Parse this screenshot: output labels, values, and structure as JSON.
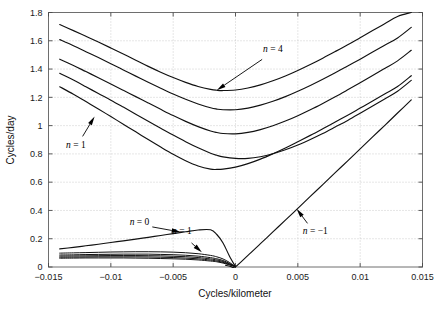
{
  "chart_data": {
    "type": "line",
    "title": "",
    "subtitle": "",
    "xlabel": "Cycles/kilometer",
    "ylabel": "Cycles/day",
    "xlim": [
      -0.015,
      0.015
    ],
    "ylim": [
      0,
      1.8
    ],
    "xticks": [
      -0.015,
      -0.01,
      -0.005,
      0,
      0.005,
      0.01,
      0.015
    ],
    "xticklabels": [
      "-0.015",
      "-0.01",
      "-0.005",
      "0",
      "0.005",
      "0.01",
      "0.015"
    ],
    "yticks": [
      0,
      0.2,
      0.4,
      0.6,
      0.8,
      1,
      1.2,
      1.4,
      1.6,
      1.8
    ],
    "yticklabels": [
      "0",
      "0.2",
      "0.4",
      "0.6",
      "0.8",
      "1",
      "1.2",
      "1.4",
      "1.6",
      "1.8"
    ],
    "grid": true,
    "legend_position": "none",
    "line_color": "#111111",
    "grid_color": "#b9b9b9",
    "frame_color": "#6e6e6e",
    "series": [
      {
        "name": "upper-branch-5",
        "comment": "highest U-shaped dispersion curve",
        "x": [
          -0.0141,
          -0.013,
          -0.012,
          -0.011,
          -0.01,
          -0.009,
          -0.008,
          -0.007,
          -0.006,
          -0.005,
          -0.004,
          -0.003,
          -0.002,
          -0.0015,
          -0.001,
          0.0,
          0.001,
          0.002,
          0.003,
          0.004,
          0.005,
          0.006,
          0.007,
          0.008,
          0.009,
          0.01,
          0.011,
          0.012,
          0.013,
          0.0141
        ],
        "y": [
          1.715,
          1.672,
          1.632,
          1.591,
          1.549,
          1.506,
          1.463,
          1.419,
          1.378,
          1.34,
          1.306,
          1.277,
          1.256,
          1.25,
          1.248,
          1.252,
          1.266,
          1.288,
          1.317,
          1.351,
          1.39,
          1.432,
          1.477,
          1.524,
          1.572,
          1.622,
          1.672,
          1.723,
          1.772,
          1.8
        ]
      },
      {
        "name": "upper-branch-4",
        "x": [
          -0.0141,
          -0.013,
          -0.012,
          -0.011,
          -0.01,
          -0.009,
          -0.008,
          -0.007,
          -0.006,
          -0.005,
          -0.004,
          -0.003,
          -0.002,
          -0.0015,
          -0.001,
          0.0,
          0.001,
          0.002,
          0.003,
          0.004,
          0.005,
          0.006,
          0.007,
          0.008,
          0.009,
          0.01,
          0.011,
          0.012,
          0.013,
          0.0141
        ],
        "y": [
          1.608,
          1.565,
          1.523,
          1.481,
          1.438,
          1.394,
          1.35,
          1.306,
          1.264,
          1.223,
          1.186,
          1.153,
          1.126,
          1.117,
          1.112,
          1.112,
          1.124,
          1.145,
          1.172,
          1.205,
          1.243,
          1.284,
          1.328,
          1.374,
          1.422,
          1.47,
          1.52,
          1.57,
          1.62,
          1.695
        ]
      },
      {
        "name": "upper-branch-3",
        "x": [
          -0.0141,
          -0.013,
          -0.012,
          -0.011,
          -0.01,
          -0.009,
          -0.008,
          -0.007,
          -0.006,
          -0.005,
          -0.004,
          -0.003,
          -0.002,
          -0.0015,
          -0.001,
          0.0,
          0.001,
          0.002,
          0.003,
          0.004,
          0.005,
          0.006,
          0.007,
          0.008,
          0.009,
          0.01,
          0.011,
          0.012,
          0.013,
          0.0141
        ],
        "y": [
          1.47,
          1.425,
          1.382,
          1.339,
          1.295,
          1.25,
          1.205,
          1.16,
          1.115,
          1.071,
          1.03,
          0.993,
          0.962,
          0.951,
          0.944,
          0.942,
          0.952,
          0.972,
          0.999,
          1.032,
          1.07,
          1.112,
          1.157,
          1.204,
          1.253,
          1.303,
          1.354,
          1.406,
          1.458,
          1.533
        ]
      },
      {
        "name": "upper-branch-2",
        "x": [
          -0.0141,
          -0.013,
          -0.012,
          -0.011,
          -0.01,
          -0.009,
          -0.008,
          -0.007,
          -0.006,
          -0.005,
          -0.004,
          -0.003,
          -0.002,
          -0.0015,
          -0.001,
          0.0,
          0.001,
          0.002,
          0.003,
          0.004,
          0.005,
          0.006,
          0.007,
          0.008,
          0.009,
          0.01,
          0.011,
          0.012,
          0.013,
          0.0141
        ],
        "y": [
          1.37,
          1.322,
          1.275,
          1.227,
          1.18,
          1.131,
          1.081,
          1.031,
          0.982,
          0.933,
          0.886,
          0.843,
          0.805,
          0.79,
          0.779,
          0.768,
          0.768,
          0.78,
          0.801,
          0.829,
          0.863,
          0.902,
          0.944,
          0.99,
          1.037,
          1.087,
          1.138,
          1.19,
          1.243,
          1.32
        ]
      },
      {
        "name": "upper-branch-1",
        "x": [
          -0.0141,
          -0.013,
          -0.012,
          -0.011,
          -0.01,
          -0.009,
          -0.008,
          -0.007,
          -0.006,
          -0.005,
          -0.004,
          -0.003,
          -0.002,
          -0.0015,
          -0.001,
          0.0,
          0.001,
          0.002,
          0.003,
          0.004,
          0.005,
          0.006,
          0.007,
          0.008,
          0.009,
          0.01,
          0.011,
          0.012,
          0.013,
          0.0141
        ],
        "y": [
          1.275,
          1.222,
          1.17,
          1.118,
          1.064,
          1.01,
          0.956,
          0.901,
          0.848,
          0.797,
          0.751,
          0.714,
          0.692,
          0.69,
          0.692,
          0.706,
          0.731,
          0.763,
          0.801,
          0.842,
          0.886,
          0.931,
          0.978,
          1.026,
          1.074,
          1.124,
          1.174,
          1.225,
          1.276,
          1.353
        ]
      },
      {
        "name": "n-minus-1-branch",
        "comment": "curve rising from origin, labelled n = -1",
        "x": [
          -0.0008,
          -0.0004,
          0.0,
          0.001,
          0.002,
          0.003,
          0.004,
          0.005,
          0.006,
          0.007,
          0.008,
          0.009,
          0.01,
          0.011,
          0.012,
          0.013,
          0.0141
        ],
        "y": [
          0.012,
          0.004,
          0.002,
          0.082,
          0.165,
          0.248,
          0.331,
          0.415,
          0.499,
          0.583,
          0.667,
          0.751,
          0.835,
          0.92,
          1.004,
          1.089,
          1.182
        ]
      },
      {
        "name": "n-0-branch",
        "comment": "gently rising curve labelled n = 0, from 0.13 at left down to 0 near origin",
        "x": [
          -0.0141,
          -0.013,
          -0.012,
          -0.011,
          -0.01,
          -0.009,
          -0.008,
          -0.007,
          -0.006,
          -0.005,
          -0.004,
          -0.003,
          -0.002,
          -0.0015,
          -0.001,
          -0.0005,
          0.0
        ],
        "y": [
          0.128,
          0.139,
          0.15,
          0.161,
          0.173,
          0.185,
          0.197,
          0.21,
          0.223,
          0.236,
          0.249,
          0.262,
          0.263,
          0.23,
          0.17,
          0.08,
          0.002
        ]
      },
      {
        "name": "lower-bunch-a",
        "x": [
          -0.0141,
          -0.013,
          -0.012,
          -0.011,
          -0.01,
          -0.009,
          -0.008,
          -0.007,
          -0.006,
          -0.005,
          -0.004,
          -0.003,
          -0.002,
          -0.0015,
          -0.001,
          -0.0005,
          0.0
        ],
        "y": [
          0.098,
          0.1,
          0.102,
          0.104,
          0.106,
          0.107,
          0.108,
          0.108,
          0.107,
          0.105,
          0.101,
          0.094,
          0.082,
          0.072,
          0.057,
          0.033,
          0.002
        ]
      },
      {
        "name": "lower-bunch-b",
        "x": [
          -0.0141,
          -0.013,
          -0.012,
          -0.011,
          -0.01,
          -0.009,
          -0.008,
          -0.007,
          -0.006,
          -0.005,
          -0.004,
          -0.003,
          -0.002,
          -0.0015,
          -0.001,
          -0.0005,
          0.0
        ],
        "y": [
          0.085,
          0.086,
          0.088,
          0.089,
          0.09,
          0.091,
          0.091,
          0.091,
          0.089,
          0.087,
          0.083,
          0.077,
          0.066,
          0.058,
          0.046,
          0.026,
          0.002
        ]
      },
      {
        "name": "lower-bunch-c",
        "x": [
          -0.0141,
          -0.013,
          -0.012,
          -0.011,
          -0.01,
          -0.009,
          -0.008,
          -0.007,
          -0.006,
          -0.005,
          -0.004,
          -0.003,
          -0.002,
          -0.0015,
          -0.001,
          -0.0005,
          0.0
        ],
        "y": [
          0.077,
          0.078,
          0.079,
          0.08,
          0.081,
          0.081,
          0.081,
          0.08,
          0.079,
          0.076,
          0.073,
          0.067,
          0.057,
          0.05,
          0.039,
          0.022,
          0.002
        ]
      },
      {
        "name": "lower-bunch-d",
        "x": [
          -0.0141,
          -0.013,
          -0.012,
          -0.011,
          -0.01,
          -0.009,
          -0.008,
          -0.007,
          -0.006,
          -0.005,
          -0.004,
          -0.003,
          -0.002,
          -0.0015,
          -0.001,
          -0.0005,
          0.0
        ],
        "y": [
          0.069,
          0.07,
          0.071,
          0.072,
          0.072,
          0.072,
          0.072,
          0.071,
          0.069,
          0.067,
          0.063,
          0.058,
          0.049,
          0.043,
          0.033,
          0.018,
          0.002
        ]
      },
      {
        "name": "lower-bunch-e",
        "x": [
          -0.0141,
          -0.013,
          -0.012,
          -0.011,
          -0.01,
          -0.009,
          -0.008,
          -0.007,
          -0.006,
          -0.005,
          -0.004,
          -0.003,
          -0.002,
          -0.0015,
          -0.001,
          -0.0005,
          0.0
        ],
        "y": [
          0.062,
          0.063,
          0.064,
          0.064,
          0.064,
          0.064,
          0.063,
          0.062,
          0.06,
          0.058,
          0.055,
          0.05,
          0.042,
          0.037,
          0.028,
          0.015,
          0.002
        ]
      }
    ],
    "annotations": [
      {
        "name": "n-equals-4",
        "text": "n = 4",
        "label_x": 0.003,
        "label_y": 1.52,
        "target_x": -0.0015,
        "target_y": 1.25
      },
      {
        "name": "n-equals-1-upper",
        "text": "n = 1",
        "label_x": -0.0128,
        "label_y": 0.845,
        "target_x": -0.0113,
        "target_y": 1.065
      },
      {
        "name": "n-equals-0",
        "text": "n = 0",
        "label_x": -0.0077,
        "label_y": 0.3,
        "target_x": -0.0044,
        "target_y": 0.247
      },
      {
        "name": "n-equals-1-lower",
        "text": "n = 1",
        "label_x": -0.0043,
        "label_y": 0.232,
        "target_x": -0.0027,
        "target_y": 0.104
      },
      {
        "name": "n-equals-minus-1",
        "text": "n = -1",
        "label_x": 0.0064,
        "label_y": 0.235,
        "target_x": 0.0049,
        "target_y": 0.412
      }
    ]
  },
  "axes": {
    "ylabel": "Cycles/day",
    "xlabel": "Cycles/kilometer"
  }
}
